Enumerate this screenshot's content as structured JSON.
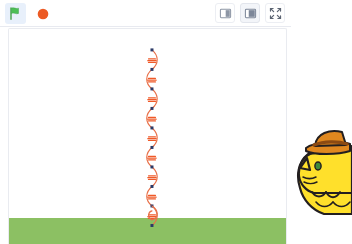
{
  "app": {
    "title": "Scratch Stage Player",
    "background_color": "#ffffff"
  },
  "toolbar": {
    "green_flag": {
      "name": "green-flag",
      "label": "Go",
      "color": "#4cbf56",
      "state": "selected"
    },
    "stop_button": {
      "name": "stop-sign",
      "label": "Stop",
      "color": "#ec5a24",
      "state": "idle"
    },
    "stage_size_controls": [
      {
        "name": "small-stage",
        "label": "Small stage layout",
        "active": false
      },
      {
        "name": "large-stage",
        "label": "Large stage layout",
        "active": true
      },
      {
        "name": "fullscreen",
        "label": "Full screen control",
        "active": false
      }
    ]
  },
  "stage": {
    "name": "stage",
    "width": 279,
    "height": 216,
    "backdrop_color": "#ffffff",
    "ground": {
      "name": "ground-strip",
      "color": "#8cc063",
      "height": 26
    }
  },
  "pen_drawing": {
    "description": "Vertical repeating chain of curved segments with tick marks and square dots",
    "center_x": 152,
    "top_y": 49,
    "bottom_y": 226,
    "segment_count": 9,
    "segment_height": 19.6,
    "curve_color": "#e8714a",
    "tick_color": "#f05a28",
    "dot_color": "#2b3a67",
    "dot_size": 3,
    "line_width": 1.2,
    "curve_amplitude": 7,
    "nodes_y": [
      49,
      68.6,
      88.2,
      107.8,
      127.4,
      147,
      166.6,
      186.2,
      205.8,
      225.4
    ],
    "tick_marks_per_segment": 3
  },
  "sprite": {
    "name": "cat-sprite",
    "label": "Cat with hat",
    "body_color": "#ffe02b",
    "body_shade": "#f7d117",
    "outline_color": "#231f20",
    "hat_color": "#e0881f",
    "hat_band_color": "#8c4a12",
    "eye_color": "#3f8a3a",
    "x": 294,
    "y": 124,
    "width": 58,
    "height": 92
  }
}
